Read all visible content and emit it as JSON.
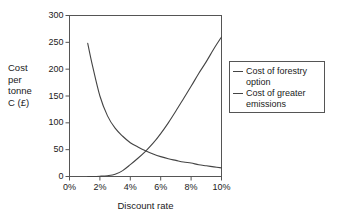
{
  "chart_data": {
    "type": "line",
    "title": "",
    "xlabel": "Discount rate",
    "ylabel": "Cost per tonne C (£)",
    "ylabel_lines": [
      "Cost",
      "per",
      "tonne",
      "C (£)"
    ],
    "xlim": [
      0,
      10
    ],
    "ylim": [
      0,
      300
    ],
    "xticks": [
      0,
      2,
      4,
      6,
      8,
      10
    ],
    "xticklabels": [
      "0%",
      "2%",
      "4%",
      "6%",
      "8%",
      "10%"
    ],
    "yticks": [
      0,
      50,
      100,
      150,
      200,
      250,
      300
    ],
    "yticklabels": [
      "0",
      "50",
      "100",
      "150",
      "200",
      "250",
      "300"
    ],
    "grid": false,
    "legend_position": "right",
    "x": [
      1.2,
      1.5,
      2,
      2.5,
      3,
      3.5,
      4,
      4.5,
      5,
      5.5,
      6,
      6.5,
      7,
      7.5,
      8,
      8.5,
      9,
      9.5,
      10
    ],
    "series": [
      {
        "name": "Cost of forestry option",
        "color": "#444444",
        "values": [
          248,
          208,
          150,
          113,
          90,
          75,
          63,
          55,
          48,
          42,
          37,
          33,
          30,
          27,
          25,
          22,
          20,
          18,
          16
        ]
      },
      {
        "name": "Cost of greater emissions",
        "color": "#444444",
        "values": [
          0,
          0,
          0.5,
          1.5,
          4,
          11,
          22,
          34,
          47,
          62,
          80,
          100,
          122,
          145,
          168,
          192,
          214,
          238,
          260
        ]
      }
    ],
    "annotations": {
      "crossover_x": 5,
      "crossover_y": 48
    }
  },
  "legend": {
    "entries": [
      {
        "label_line1": "Cost of forestry",
        "label_line2": "option"
      },
      {
        "label_line1": "Cost of greater",
        "label_line2": "emissions"
      }
    ]
  },
  "colors": {
    "line": "#444444",
    "frame": "#555555",
    "text": "#1a1a1a",
    "background": "#ffffff"
  }
}
